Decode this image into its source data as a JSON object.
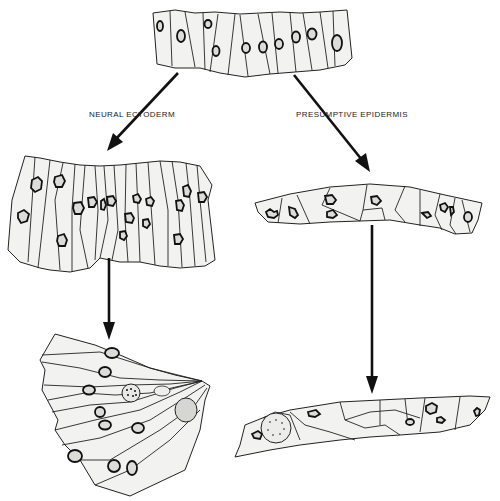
{
  "figure": {
    "stages": {
      "top": {
        "name": "ectoderm-sheet"
      },
      "left_middle": {
        "name": "neural-ectoderm-columnar-sheet"
      },
      "left_bottom": {
        "name": "neural-fold-wedge-cells"
      },
      "right_middle": {
        "name": "epidermis-flattened-sheet"
      },
      "right_bottom": {
        "name": "epidermis-thin-sheet"
      }
    },
    "labels": {
      "left_branch": "NEURAL ECTODERM",
      "right_branch": "PRESUMPTIVE EPIDERMIS"
    },
    "colors": {
      "ink": "#111111",
      "cytoplasm": "#f2f2f0",
      "nucleus": "#dcdcd8",
      "background": "#ffffff"
    }
  }
}
